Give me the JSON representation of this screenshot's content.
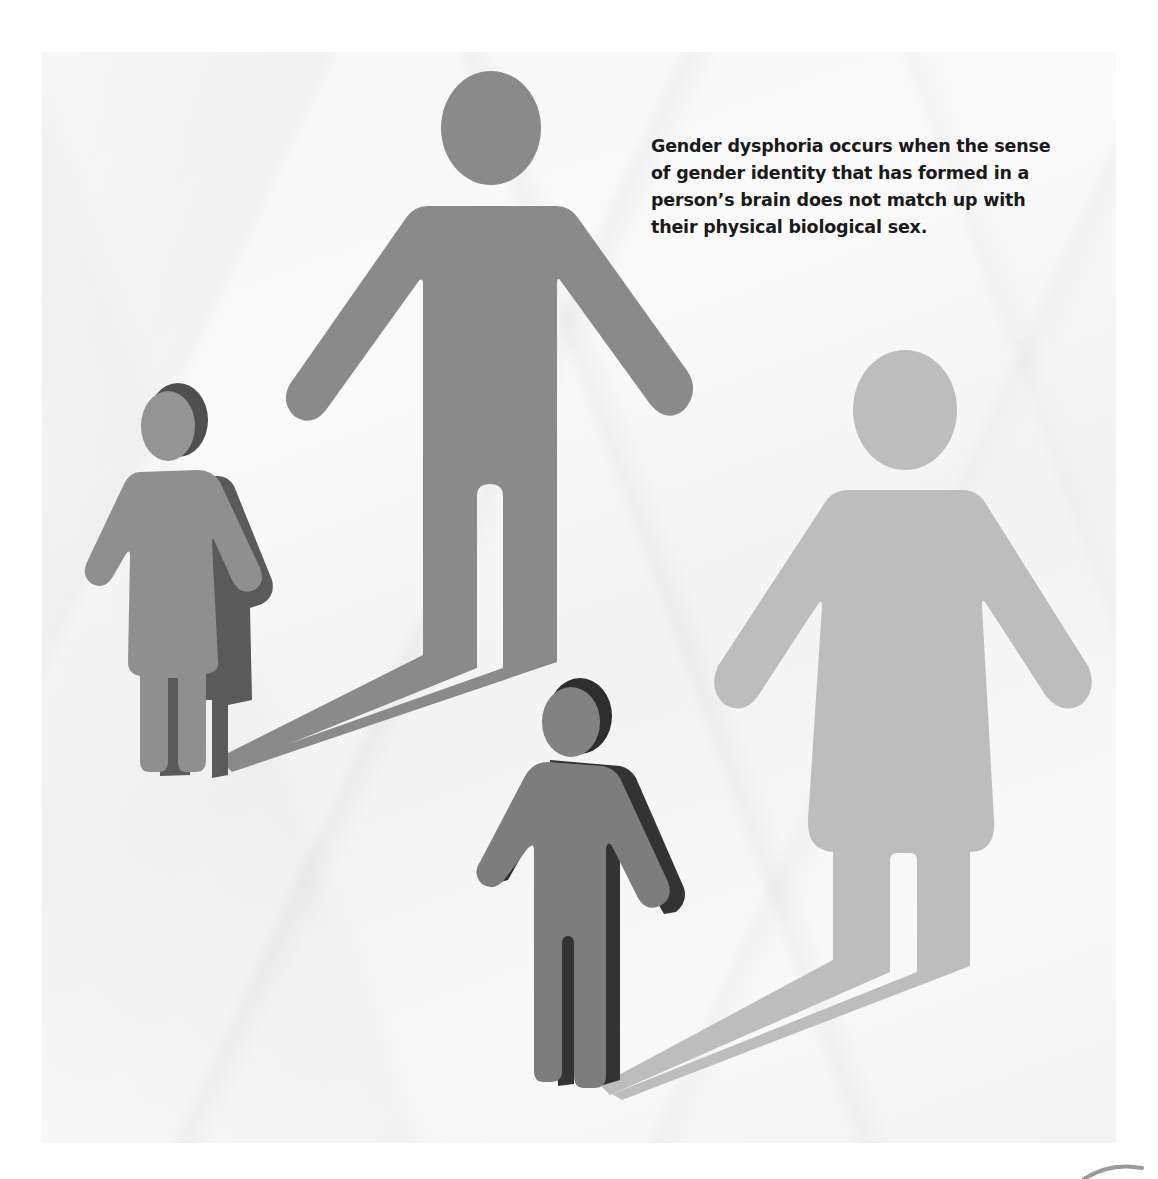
{
  "caption": {
    "text": "Gender dysphoria occurs when the sense of gender identity that has formed in a person’s brain does not match up with their physical biological sex."
  },
  "figures": [
    {
      "id": "small-girl-figure",
      "kind": "3d-figure",
      "gender_symbol": "female",
      "color": "#8f8f8f",
      "side_color": "#4a4a4a"
    },
    {
      "id": "man-shadow",
      "kind": "flat-shadow",
      "gender_symbol": "male",
      "color": "#8a8a8a"
    },
    {
      "id": "small-boy-figure",
      "kind": "3d-figure",
      "gender_symbol": "male",
      "color": "#7d7d7d",
      "side_color": "#2e2e2e"
    },
    {
      "id": "woman-shadow",
      "kind": "flat-shadow",
      "gender_symbol": "female",
      "color": "#bdbdbd"
    }
  ],
  "background": {
    "page": "#ffffff",
    "paper": "#f6f6f6"
  }
}
